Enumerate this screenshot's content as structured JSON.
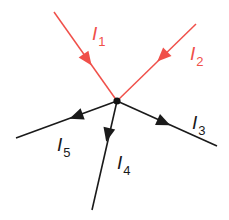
{
  "diagram": {
    "colors": {
      "incoming": "#f0504a",
      "outgoing": "#1a1a1a",
      "junction": "#111111"
    },
    "junction": {
      "x": 117,
      "y": 101
    },
    "currents": [
      {
        "id": "I1",
        "symbol": "I",
        "subscript": "1",
        "direction": "into junction",
        "color": "#f0504a",
        "from": [
          54,
          12
        ],
        "to": [
          117,
          101
        ],
        "label_pos": [
          92,
          24
        ]
      },
      {
        "id": "I2",
        "symbol": "I",
        "subscript": "2",
        "direction": "into junction",
        "color": "#f0504a",
        "from": [
          196,
          24
        ],
        "to": [
          117,
          101
        ],
        "label_pos": [
          190,
          44
        ]
      },
      {
        "id": "I3",
        "symbol": "I",
        "subscript": "3",
        "direction": "out of junction",
        "color": "#1a1a1a",
        "from": [
          117,
          101
        ],
        "to": [
          217,
          146
        ],
        "label_pos": [
          192,
          113
        ]
      },
      {
        "id": "I4",
        "symbol": "I",
        "subscript": "4",
        "direction": "out of junction",
        "color": "#1a1a1a",
        "from": [
          117,
          101
        ],
        "to": [
          92,
          210
        ],
        "label_pos": [
          117,
          153
        ]
      },
      {
        "id": "I5",
        "symbol": "I",
        "subscript": "5",
        "direction": "out of junction",
        "color": "#1a1a1a",
        "from": [
          117,
          101
        ],
        "to": [
          16,
          138
        ],
        "label_pos": [
          57,
          135
        ]
      }
    ]
  }
}
